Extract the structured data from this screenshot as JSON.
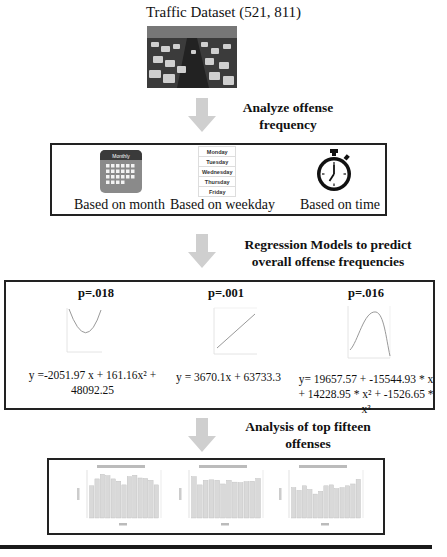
{
  "diagram": {
    "title": "Traffic Dataset (521, 811)",
    "dataset_image": "traffic-jam-photo",
    "steps": [
      {
        "label_line1": "Analyze offense",
        "label_line2": "frequency"
      },
      {
        "label_line1": "Regression Models to predict",
        "label_line2": "overall offense frequencies"
      },
      {
        "label_line1": "Analysis of top fifteen",
        "label_line2": "offenses"
      }
    ],
    "frequency_box": {
      "items": [
        {
          "icon": "calendar-icon",
          "icon_header": "Monthly",
          "caption": "Based on month"
        },
        {
          "icon": "weekday-list-icon",
          "weekdays": [
            "Monday",
            "Tuesday",
            "Wednesday",
            "Thursday",
            "Friday"
          ],
          "caption": "Based on weekday"
        },
        {
          "icon": "stopwatch-icon",
          "caption": "Based on time"
        }
      ]
    },
    "regression_box": {
      "models": [
        {
          "p_value": "p=.018",
          "curve": "quadratic-u",
          "equation_line1": "y =-2051.97 x + 161.16x² + 48092.25",
          "equation_line2": ""
        },
        {
          "p_value": "p=.001",
          "curve": "linear",
          "equation_line1": "y = 3670.1x + 63733.3",
          "equation_line2": ""
        },
        {
          "p_value": "p=.016",
          "curve": "cubic",
          "equation_line1": "y= 19657.57 + -15544.93 * x",
          "equation_line2": "+ 14228.95 * x² + -1526.65 * x³"
        }
      ]
    },
    "top_offenses_box": {
      "charts": [
        {
          "type": "bar",
          "bars": [
            0.7,
            0.85,
            0.95,
            0.92,
            0.85,
            0.8,
            0.72,
            0.9,
            0.93,
            0.87,
            0.86,
            0.82,
            0.72
          ]
        },
        {
          "type": "bar",
          "bars": [
            0.9,
            0.72,
            0.82,
            0.83,
            0.82,
            0.74,
            0.82,
            0.78,
            0.77,
            0.79,
            0.8,
            0.86
          ]
        },
        {
          "type": "bar",
          "bars": [
            0.66,
            0.6,
            0.7,
            0.62,
            0.52,
            0.58,
            0.7,
            0.72,
            0.64,
            0.66,
            0.7,
            0.74,
            0.84
          ]
        }
      ]
    }
  },
  "colors": {
    "arrow": "#cfcfcf",
    "border": "#222222",
    "bar_fill": "#d9d9d9",
    "calendar_header": "#3a3a3a",
    "calendar_body": "#8a8a8a"
  }
}
